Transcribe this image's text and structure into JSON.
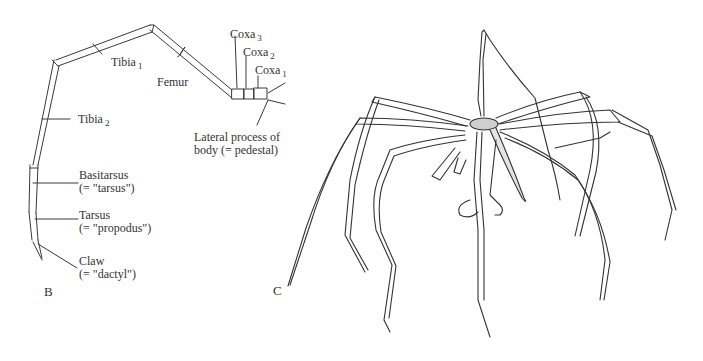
{
  "figure": {
    "panel_b": {
      "letter": "B",
      "labels": {
        "coxa3": {
          "text": "Coxa",
          "sub": "3"
        },
        "coxa2": {
          "text": "Coxa",
          "sub": "2"
        },
        "coxa1": {
          "text": "Coxa",
          "sub": "1"
        },
        "femur": {
          "text": "Femur"
        },
        "tibia1": {
          "text": "Tibia",
          "sub": "1"
        },
        "tibia2": {
          "text": "Tibia",
          "sub": "2"
        },
        "lateral_process_line1": "Lateral process of",
        "lateral_process_line2": "body (= pedestal)",
        "basitarsus_line1": "Basitarsus",
        "basitarsus_line2": "(= \"tarsus\")",
        "tarsus_line1": "Tarsus",
        "tarsus_line2": "(= \"propodus\")",
        "claw_line1": "Claw",
        "claw_line2": "(= \"dactyl\")"
      }
    },
    "panel_c": {
      "letter": "C",
      "subject": "sea-spider-illustration"
    },
    "colors": {
      "background": "#ffffff",
      "ink": "#2a2a2a"
    }
  }
}
